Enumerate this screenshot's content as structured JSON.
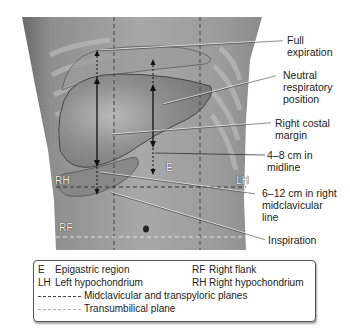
{
  "figure": {
    "type": "anatomical-diagram"
  },
  "callouts": {
    "full_expiration": [
      "Full",
      "expiration"
    ],
    "neutral_respiratory": [
      "Neutral",
      "respiratory",
      "position"
    ],
    "right_costal_margin": [
      "Right costal",
      "margin"
    ],
    "midline_span": [
      "4–8 cm in",
      "midline"
    ],
    "mcl_span": [
      "6–12 cm in right",
      "midclavicular",
      "line"
    ],
    "inspiration": [
      "Inspiration"
    ]
  },
  "region_labels": {
    "E": "E",
    "RH": "RH",
    "LH": "LH",
    "RF": "RF"
  },
  "legend": {
    "items": [
      {
        "abbr": "E",
        "label": "Epigastric region"
      },
      {
        "abbr": "RF",
        "label": "Right flank"
      },
      {
        "abbr": "LH",
        "label": "Left hypochondrium"
      },
      {
        "abbr": "RH",
        "label": "Right hypochondrium"
      }
    ],
    "lines": [
      {
        "style": "dark-dashed",
        "label": "Midclavicular and transpyloric planes"
      },
      {
        "style": "light-dashed",
        "label": "Transumbilical plane"
      }
    ]
  },
  "colors": {
    "skin_dark": "#6e6e6e",
    "skin_mid": "#9a9a9a",
    "skin_light": "#bdbdbd",
    "liver": "#8c8c8c",
    "arrow": "#111111",
    "dashed_dark": "#444444",
    "dashed_light": "#d8d8d8"
  }
}
